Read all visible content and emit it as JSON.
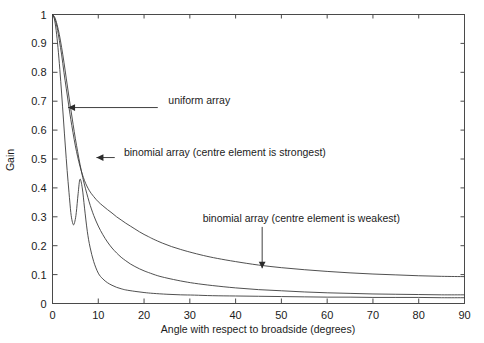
{
  "chart_data": {
    "type": "line",
    "title": "",
    "xlabel": "Angle with respect to broadside (degrees)",
    "ylabel": "Gain",
    "xlim": [
      0,
      90
    ],
    "ylim": [
      0,
      1
    ],
    "xticks": [
      0,
      10,
      20,
      30,
      40,
      50,
      60,
      70,
      80,
      90
    ],
    "xtick_labels": [
      "0",
      "10",
      "20",
      "30",
      "40",
      "50",
      "60",
      "70",
      "80",
      "90"
    ],
    "yticks": [
      0,
      0.1,
      0.2,
      0.3,
      0.4,
      0.5,
      0.6,
      0.7,
      0.8,
      0.9,
      1
    ],
    "ytick_labels": [
      "0",
      "0.1",
      "0.2",
      "0.3",
      "0.4",
      "0.5",
      "0.6",
      "0.7",
      "0.8",
      "0.9",
      "1"
    ],
    "grid": false,
    "legend_position": "none",
    "minor_ticks_all_sides": true,
    "series": [
      {
        "name": "uniform array",
        "x": [
          0,
          0.4,
          0.8,
          1.2,
          1.6,
          2.0,
          2.4,
          2.8,
          3.2,
          3.6,
          4.0,
          4.3,
          4.6,
          4.9,
          5.2,
          5.6,
          6.0,
          6.5,
          7.0,
          7.6,
          8.2,
          9.0,
          10.0,
          11.0,
          12.0,
          13.0,
          14.0,
          15.0,
          16.0,
          18.0,
          20.0,
          22.0,
          25.0,
          28.0,
          31.0,
          35.0,
          40.0,
          45.0,
          50.0,
          55.0,
          60.0,
          65.0,
          70.0,
          75.0,
          80.0,
          85.0,
          90.0
        ],
        "y": [
          1.0,
          0.985,
          0.945,
          0.885,
          0.81,
          0.725,
          0.635,
          0.545,
          0.46,
          0.385,
          0.315,
          0.285,
          0.272,
          0.285,
          0.315,
          0.38,
          0.43,
          0.4,
          0.33,
          0.25,
          0.195,
          0.145,
          0.105,
          0.085,
          0.072,
          0.063,
          0.056,
          0.051,
          0.047,
          0.042,
          0.038,
          0.035,
          0.032,
          0.03,
          0.029,
          0.027,
          0.026,
          0.025,
          0.024,
          0.023,
          0.022,
          0.022,
          0.021,
          0.021,
          0.021,
          0.02,
          0.02
        ]
      },
      {
        "name": "binomial array (centre element is strongest)",
        "x": [
          0,
          0.5,
          1.0,
          1.5,
          2.0,
          2.5,
          3.0,
          3.5,
          4.0,
          4.5,
          5.0,
          5.5,
          6.0,
          6.5,
          7.0,
          8.0,
          9.0,
          10.0,
          11.0,
          12.0,
          13.0,
          14.0,
          15.0,
          16.0,
          17.0,
          18.0,
          19.0,
          20.0,
          21.0,
          23.0,
          25.0,
          28.0,
          31.0,
          35.0,
          40.0,
          45.0,
          50.0,
          55.0,
          60.0,
          65.0,
          70.0,
          75.0,
          80.0,
          85.0,
          90.0
        ],
        "y": [
          1.0,
          0.99,
          0.965,
          0.93,
          0.885,
          0.835,
          0.78,
          0.725,
          0.672,
          0.62,
          0.57,
          0.525,
          0.482,
          0.444,
          0.41,
          0.352,
          0.305,
          0.268,
          0.238,
          0.213,
          0.192,
          0.175,
          0.16,
          0.148,
          0.137,
          0.128,
          0.12,
          0.113,
          0.107,
          0.096,
          0.088,
          0.078,
          0.07,
          0.062,
          0.054,
          0.048,
          0.044,
          0.04,
          0.037,
          0.035,
          0.033,
          0.032,
          0.031,
          0.03,
          0.03
        ]
      },
      {
        "name": "binomial array (centre element is weakest)",
        "x": [
          0,
          0.5,
          1.0,
          1.5,
          2.0,
          2.5,
          3.0,
          3.5,
          4.0,
          5.0,
          6.0,
          7.0,
          8.0,
          9.0,
          10.0,
          11.0,
          12.0,
          13.0,
          14.0,
          15.0,
          16.0,
          17.0,
          18.0,
          19.0,
          20.0,
          21.0,
          22.0,
          24.0,
          26.0,
          28.0,
          30.0,
          33.0,
          36.0,
          40.0,
          45.0,
          50.0,
          55.0,
          60.0,
          65.0,
          70.0,
          75.0,
          80.0,
          85.0,
          90.0
        ],
        "y": [
          1.0,
          0.985,
          0.955,
          0.91,
          0.86,
          0.8,
          0.745,
          0.69,
          0.637,
          0.545,
          0.475,
          0.425,
          0.392,
          0.37,
          0.352,
          0.338,
          0.325,
          0.313,
          0.3,
          0.289,
          0.278,
          0.268,
          0.258,
          0.248,
          0.239,
          0.231,
          0.223,
          0.209,
          0.197,
          0.187,
          0.178,
          0.166,
          0.156,
          0.145,
          0.133,
          0.124,
          0.117,
          0.111,
          0.106,
          0.102,
          0.099,
          0.096,
          0.094,
          0.093
        ]
      }
    ],
    "annotations": [
      {
        "name": "uniform-array",
        "text": "uniform array",
        "label_x": 25.3,
        "label_y": 0.705,
        "arrow_from_x": 23.0,
        "arrow_from_y": 0.678,
        "arrow_to_x": 3.4,
        "arrow_to_y": 0.678,
        "style": "horizontal-leader-left-arrow"
      },
      {
        "name": "binomial-strongest",
        "text": "binomial array (centre element is strongest)",
        "label_x": 15.6,
        "label_y": 0.525,
        "arrow_from_x": 13.6,
        "arrow_from_y": 0.505,
        "arrow_to_x": 9.6,
        "arrow_to_y": 0.505,
        "style": "horizontal-leader-left-arrow"
      },
      {
        "name": "binomial-weakest",
        "text": "binomial array (centre element is weakest)",
        "label_x": 32.8,
        "label_y": 0.295,
        "arrow_from_x": 45.8,
        "arrow_from_y": 0.265,
        "arrow_to_x": 45.8,
        "arrow_to_y": 0.122,
        "style": "vertical-leader-down-arrow"
      }
    ]
  },
  "colors": {
    "axis": "#4a4a4a",
    "curve": "#3c3c3c",
    "annotation": "#2b2b2b",
    "background": "#ffffff",
    "text": "#1b1b1b"
  }
}
